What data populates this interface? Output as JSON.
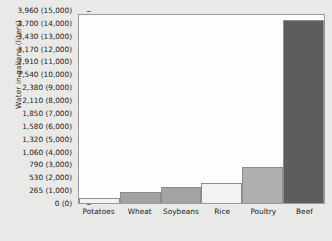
{
  "chart_data": {
    "type": "bar",
    "title": "",
    "xlabel": "",
    "ylabel": "Water in gallons (liters)",
    "categories": [
      "Potatoes",
      "Wheat",
      "Soybeans",
      "Rice",
      "Poultry",
      "Beef"
    ],
    "values": [
      400,
      900,
      1300,
      1700,
      3000,
      15200
    ],
    "value_unit": "liters",
    "ylim": [
      0,
      15600
    ],
    "grid": false,
    "legend": null,
    "axis_ticks": [
      {
        "gallons": "3,960",
        "liters": "(15,000)",
        "label": "3,960 (15,000)",
        "value": 15000
      },
      {
        "gallons": "3,700",
        "liters": "(14,000)",
        "label": "3,700 (14,000)",
        "value": 14000
      },
      {
        "gallons": "3,430",
        "liters": "(13,000)",
        "label": "3,430 (13,000)",
        "value": 13000
      },
      {
        "gallons": "3,170",
        "liters": "(12,000)",
        "label": "3,170 (12,000)",
        "value": 12000
      },
      {
        "gallons": "2,910",
        "liters": "(11,000)",
        "label": "2,910 (11,000)",
        "value": 11000
      },
      {
        "gallons": "2,540",
        "liters": "(10,000)",
        "label": "2,540 (10,000)",
        "value": 10000
      },
      {
        "gallons": "2,380",
        "liters": "(9,000)",
        "label": "2,380 (9,000)",
        "value": 9000
      },
      {
        "gallons": "2,110",
        "liters": "(8,000)",
        "label": "2,110 (8,000)",
        "value": 8000
      },
      {
        "gallons": "1,850",
        "liters": "(7,000)",
        "label": "1,850 (7,000)",
        "value": 7000
      },
      {
        "gallons": "1,580",
        "liters": "(6,000)",
        "label": "1,580 (6,000)",
        "value": 6000
      },
      {
        "gallons": "1,320",
        "liters": "(5,000)",
        "label": "1,320 (5,000)",
        "value": 5000
      },
      {
        "gallons": "1,060",
        "liters": "(4,000)",
        "label": "1,060 (4,000)",
        "value": 4000
      },
      {
        "gallons": "790",
        "liters": "(3,000)",
        "label": "790 (3,000)",
        "value": 3000
      },
      {
        "gallons": "530",
        "liters": "(2,000)",
        "label": "530 (2,000)",
        "value": 2000
      },
      {
        "gallons": "265",
        "liters": "(1,000)",
        "label": "265 (1,000)",
        "value": 1000
      },
      {
        "gallons": "0",
        "liters": "(0)",
        "label": "0 (0)",
        "value": 0
      }
    ],
    "bar_colors": [
      "#f2f2f2",
      "#a3a3a3",
      "#a3a3a3",
      "#f2f2f2",
      "#b0b0b0",
      "#5d5d5d"
    ]
  },
  "style": {
    "page_background": "#e9e9e7",
    "plot_background": "#fdfdfd",
    "axis_color": "#9a9a9a",
    "text_color": "#1c1c1c"
  }
}
